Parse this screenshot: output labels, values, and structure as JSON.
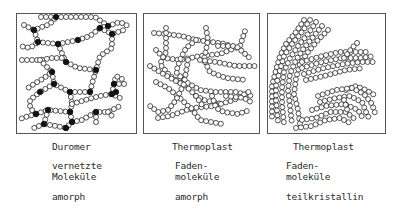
{
  "colors": {
    "stroke": "#2a2a2a",
    "bead_fill": "#ffffff",
    "crosslink_fill": "#111111",
    "frame": "#555555"
  },
  "bead_radius": 2.5,
  "bead_spacing": 5,
  "panels": [
    {
      "id": "duromer",
      "frame": {
        "x": 16,
        "y": 13,
        "w": 120,
        "h": 120
      },
      "title": "Duromer",
      "structure_line1": "vernetzte",
      "structure_line2": "Moleküle",
      "morphology": "amorph",
      "chains": [
        [
          [
            41,
            17
          ],
          [
            95,
            17
          ],
          [
            108,
            26
          ]
        ],
        [
          [
            24,
            25
          ],
          [
            34,
            30
          ],
          [
            50,
            24
          ],
          [
            56,
            17
          ]
        ],
        [
          [
            34,
            30
          ],
          [
            38,
            42
          ],
          [
            30,
            48
          ],
          [
            20,
            46
          ]
        ],
        [
          [
            38,
            42
          ],
          [
            58,
            44
          ],
          [
            78,
            40
          ],
          [
            90,
            36
          ],
          [
            100,
            28
          ],
          [
            108,
            26
          ]
        ],
        [
          [
            108,
            26
          ],
          [
            120,
            22
          ],
          [
            128,
            26
          ]
        ],
        [
          [
            100,
            28
          ],
          [
            112,
            34
          ],
          [
            124,
            30
          ]
        ],
        [
          [
            112,
            34
          ],
          [
            112,
            48
          ],
          [
            100,
            56
          ],
          [
            96,
            70
          ],
          [
            92,
            84
          ],
          [
            90,
            92
          ]
        ],
        [
          [
            58,
            44
          ],
          [
            64,
            58
          ],
          [
            66,
            62
          ],
          [
            78,
            68
          ],
          [
            96,
            70
          ]
        ],
        [
          [
            22,
            60
          ],
          [
            40,
            60
          ],
          [
            52,
            58
          ],
          [
            64,
            58
          ]
        ],
        [
          [
            40,
            60
          ],
          [
            52,
            72
          ],
          [
            44,
            78
          ],
          [
            34,
            84
          ],
          [
            28,
            88
          ]
        ],
        [
          [
            52,
            72
          ],
          [
            54,
            84
          ],
          [
            70,
            92
          ],
          [
            90,
            92
          ]
        ],
        [
          [
            54,
            84
          ],
          [
            40,
            92
          ],
          [
            30,
            100
          ],
          [
            30,
            108
          ],
          [
            36,
            114
          ]
        ],
        [
          [
            36,
            114
          ],
          [
            22,
            118
          ],
          [
            20,
            122
          ]
        ],
        [
          [
            70,
            92
          ],
          [
            72,
            104
          ],
          [
            70,
            112
          ],
          [
            48,
            110
          ],
          [
            36,
            114
          ]
        ],
        [
          [
            72,
            104
          ],
          [
            92,
            98
          ],
          [
            100,
            96
          ],
          [
            112,
            94
          ],
          [
            120,
            98
          ]
        ],
        [
          [
            112,
            94
          ],
          [
            114,
            84
          ],
          [
            116,
            76
          ],
          [
            124,
            80
          ]
        ],
        [
          [
            114,
            84
          ],
          [
            126,
            84
          ]
        ],
        [
          [
            48,
            110
          ],
          [
            44,
            124
          ],
          [
            34,
            128
          ]
        ],
        [
          [
            70,
            112
          ],
          [
            72,
            122
          ],
          [
            66,
            128
          ],
          [
            56,
            126
          ],
          [
            44,
            124
          ]
        ],
        [
          [
            72,
            122
          ],
          [
            82,
            120
          ],
          [
            96,
            112
          ],
          [
            108,
            112
          ],
          [
            120,
            106
          ]
        ],
        [
          [
            96,
            112
          ],
          [
            96,
            124
          ]
        ],
        [
          [
            108,
            112
          ],
          [
            114,
            118
          ]
        ],
        [
          [
            66,
            128
          ],
          [
            68,
            132
          ]
        ]
      ],
      "crosslinks": [
        [
          56,
          17
        ],
        [
          108,
          26
        ],
        [
          34,
          30
        ],
        [
          100,
          28
        ],
        [
          38,
          42
        ],
        [
          112,
          34
        ],
        [
          58,
          44
        ],
        [
          78,
          40
        ],
        [
          96,
          70
        ],
        [
          90,
          92
        ],
        [
          52,
          72
        ],
        [
          66,
          62
        ],
        [
          54,
          84
        ],
        [
          70,
          92
        ],
        [
          40,
          92
        ],
        [
          36,
          114
        ],
        [
          70,
          112
        ],
        [
          48,
          110
        ],
        [
          72,
          122
        ],
        [
          66,
          128
        ],
        [
          96,
          112
        ],
        [
          112,
          94
        ],
        [
          114,
          84
        ],
        [
          116,
          92
        ],
        [
          44,
          124
        ]
      ]
    },
    {
      "id": "thermoplast-amorph",
      "frame": {
        "x": 143,
        "y": 13,
        "w": 116,
        "h": 120
      },
      "title": "Thermoplast",
      "structure_line1": "Faden-",
      "structure_line2": "moleküle",
      "morphology": "amorph",
      "chains": [
        [
          [
            154,
            33
          ],
          [
            166,
            34
          ],
          [
            182,
            36
          ],
          [
            196,
            40
          ],
          [
            212,
            42
          ],
          [
            226,
            44
          ],
          [
            236,
            50
          ]
        ],
        [
          [
            166,
            28
          ],
          [
            166,
            52
          ],
          [
            160,
            64
          ],
          [
            170,
            76
          ],
          [
            182,
            84
          ]
        ],
        [
          [
            156,
            50
          ],
          [
            164,
            58
          ],
          [
            180,
            60
          ],
          [
            200,
            56
          ],
          [
            220,
            54
          ],
          [
            240,
            46
          ],
          [
            246,
            28
          ]
        ],
        [
          [
            206,
            28
          ],
          [
            208,
            40
          ],
          [
            204,
            60
          ],
          [
            210,
            72
          ],
          [
            226,
            78
          ],
          [
            246,
            80
          ]
        ],
        [
          [
            150,
            66
          ],
          [
            160,
            72
          ],
          [
            174,
            80
          ],
          [
            186,
            86
          ],
          [
            196,
            96
          ],
          [
            204,
            100
          ],
          [
            222,
            104
          ]
        ],
        [
          [
            196,
            40
          ],
          [
            186,
            48
          ],
          [
            180,
            60
          ],
          [
            176,
            72
          ],
          [
            186,
            82
          ],
          [
            200,
            90
          ],
          [
            216,
            92
          ],
          [
            236,
            92
          ],
          [
            252,
            96
          ]
        ],
        [
          [
            200,
            60
          ],
          [
            216,
            62
          ],
          [
            236,
            66
          ],
          [
            256,
            66
          ]
        ],
        [
          [
            218,
            46
          ],
          [
            236,
            46
          ],
          [
            252,
            60
          ]
        ],
        [
          [
            156,
            82
          ],
          [
            168,
            88
          ],
          [
            182,
            100
          ],
          [
            194,
            112
          ],
          [
            200,
            120
          ],
          [
            222,
            124
          ]
        ],
        [
          [
            188,
            60
          ],
          [
            184,
            84
          ],
          [
            176,
            100
          ],
          [
            168,
            110
          ],
          [
            158,
            112
          ],
          [
            150,
            106
          ]
        ],
        [
          [
            158,
            118
          ],
          [
            170,
            116
          ],
          [
            192,
            108
          ],
          [
            214,
            106
          ],
          [
            234,
            100
          ],
          [
            252,
            90
          ]
        ],
        [
          [
            212,
            96
          ],
          [
            216,
            108
          ],
          [
            224,
            112
          ],
          [
            238,
            114
          ],
          [
            250,
            110
          ]
        ],
        [
          [
            226,
            96
          ],
          [
            244,
            98
          ],
          [
            254,
            104
          ]
        ],
        [
          [
            196,
            96
          ],
          [
            204,
            108
          ]
        ]
      ],
      "crosslinks": []
    },
    {
      "id": "thermoplast-teilkristallin",
      "frame": {
        "x": 267,
        "y": 13,
        "w": 118,
        "h": 120
      },
      "title": "Thermoplast",
      "structure_line1": "Faden-",
      "structure_line2": "moleküle",
      "morphology": "teilkristallin",
      "chains": [
        [
          [
            304,
            20
          ],
          [
            296,
            32
          ],
          [
            286,
            44
          ],
          [
            280,
            56
          ],
          [
            276,
            70
          ],
          [
            272,
            86
          ],
          [
            272,
            100
          ],
          [
            272,
            120
          ]
        ],
        [
          [
            310,
            20
          ],
          [
            302,
            32
          ],
          [
            292,
            44
          ],
          [
            284,
            56
          ],
          [
            280,
            70
          ],
          [
            276,
            86
          ],
          [
            276,
            100
          ],
          [
            278,
            122
          ]
        ],
        [
          [
            316,
            22
          ],
          [
            308,
            34
          ],
          [
            298,
            46
          ],
          [
            290,
            58
          ],
          [
            284,
            72
          ],
          [
            282,
            88
          ],
          [
            282,
            104
          ],
          [
            284,
            124
          ]
        ],
        [
          [
            322,
            26
          ],
          [
            314,
            36
          ],
          [
            304,
            48
          ],
          [
            296,
            60
          ],
          [
            290,
            74
          ],
          [
            288,
            90
          ],
          [
            290,
            106
          ],
          [
            292,
            124
          ]
        ],
        [
          [
            328,
            30
          ],
          [
            318,
            40
          ],
          [
            308,
            52
          ],
          [
            300,
            64
          ],
          [
            296,
            78
          ],
          [
            294,
            94
          ],
          [
            298,
            110
          ],
          [
            300,
            124
          ]
        ],
        [
          [
            302,
            62
          ],
          [
            322,
            56
          ],
          [
            340,
            52
          ],
          [
            354,
            52
          ],
          [
            370,
            52
          ]
        ],
        [
          [
            302,
            68
          ],
          [
            322,
            62
          ],
          [
            342,
            58
          ],
          [
            360,
            58
          ],
          [
            374,
            56
          ]
        ],
        [
          [
            304,
            74
          ],
          [
            324,
            68
          ],
          [
            344,
            64
          ],
          [
            362,
            62
          ],
          [
            376,
            62
          ]
        ],
        [
          [
            306,
            80
          ],
          [
            324,
            76
          ],
          [
            346,
            70
          ],
          [
            364,
            68
          ]
        ],
        [
          [
            344,
            58
          ],
          [
            352,
            48
          ],
          [
            360,
            40
          ]
        ],
        [
          [
            346,
            90
          ],
          [
            356,
            86
          ],
          [
            366,
            90
          ],
          [
            376,
            96
          ]
        ],
        [
          [
            318,
            96
          ],
          [
            336,
            90
          ],
          [
            352,
            88
          ],
          [
            364,
            94
          ],
          [
            372,
            104
          ],
          [
            376,
            116
          ]
        ],
        [
          [
            320,
            102
          ],
          [
            336,
            98
          ],
          [
            350,
            96
          ],
          [
            362,
            102
          ],
          [
            366,
            112
          ],
          [
            370,
            120
          ]
        ],
        [
          [
            312,
            110
          ],
          [
            326,
            106
          ],
          [
            344,
            104
          ],
          [
            358,
            110
          ],
          [
            364,
            120
          ]
        ],
        [
          [
            302,
            120
          ],
          [
            316,
            118
          ],
          [
            330,
            112
          ],
          [
            346,
            112
          ],
          [
            356,
            120
          ]
        ],
        [
          [
            296,
            128
          ],
          [
            312,
            126
          ],
          [
            326,
            120
          ],
          [
            340,
            118
          ],
          [
            352,
            124
          ]
        ],
        [
          [
            344,
            100
          ],
          [
            348,
            112
          ]
        ]
      ],
      "crosslinks": []
    }
  ],
  "labels": [
    {
      "key": "d_title",
      "x": 52,
      "y": 141,
      "bind": "panels.0.title"
    },
    {
      "key": "d_s1",
      "x": 52,
      "y": 160,
      "bind": "panels.0.structure_line1"
    },
    {
      "key": "d_s2",
      "x": 52,
      "y": 171,
      "bind": "panels.0.structure_line2"
    },
    {
      "key": "d_m",
      "x": 52,
      "y": 191,
      "bind": "panels.0.morphology"
    },
    {
      "key": "t1_title",
      "x": 172,
      "y": 141,
      "bind": "panels.1.title"
    },
    {
      "key": "t1_s1",
      "x": 175,
      "y": 160,
      "bind": "panels.1.structure_line1"
    },
    {
      "key": "t1_s2",
      "x": 175,
      "y": 171,
      "bind": "panels.1.structure_line2"
    },
    {
      "key": "t1_m",
      "x": 175,
      "y": 191,
      "bind": "panels.1.morphology"
    },
    {
      "key": "t2_title",
      "x": 293,
      "y": 141,
      "bind": "panels.2.title"
    },
    {
      "key": "t2_s1",
      "x": 286,
      "y": 160,
      "bind": "panels.2.structure_line1"
    },
    {
      "key": "t2_s2",
      "x": 286,
      "y": 171,
      "bind": "panels.2.structure_line2"
    },
    {
      "key": "t2_m",
      "x": 286,
      "y": 191,
      "bind": "panels.2.morphology"
    }
  ]
}
